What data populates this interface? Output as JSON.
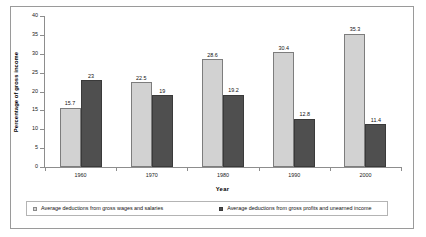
{
  "chart_data": {
    "type": "bar",
    "title": "",
    "xlabel": "Year",
    "ylabel": "Percentage of gross income",
    "categories": [
      "1960",
      "1970",
      "1980",
      "1990",
      "2000"
    ],
    "ylim": [
      0,
      40
    ],
    "yticks": [
      0,
      5,
      10,
      15,
      20,
      25,
      30,
      35,
      40
    ],
    "grid": false,
    "legend_position": "bottom",
    "series": [
      {
        "name": "Average deductions from gross wages and salaries",
        "color": "#d2d2d2",
        "values": [
          15.7,
          22.5,
          28.6,
          30.4,
          35.3
        ],
        "labels": [
          "15.7",
          "22.5",
          "28.6",
          "30.4",
          "35.3"
        ]
      },
      {
        "name": "Average deductions from gross profits and unearned income",
        "color": "#4f4f4f",
        "values": [
          23,
          19,
          19.2,
          12.8,
          11.4
        ],
        "labels": [
          "23",
          "19",
          "19.2",
          "12.8",
          "11.4"
        ]
      }
    ]
  }
}
